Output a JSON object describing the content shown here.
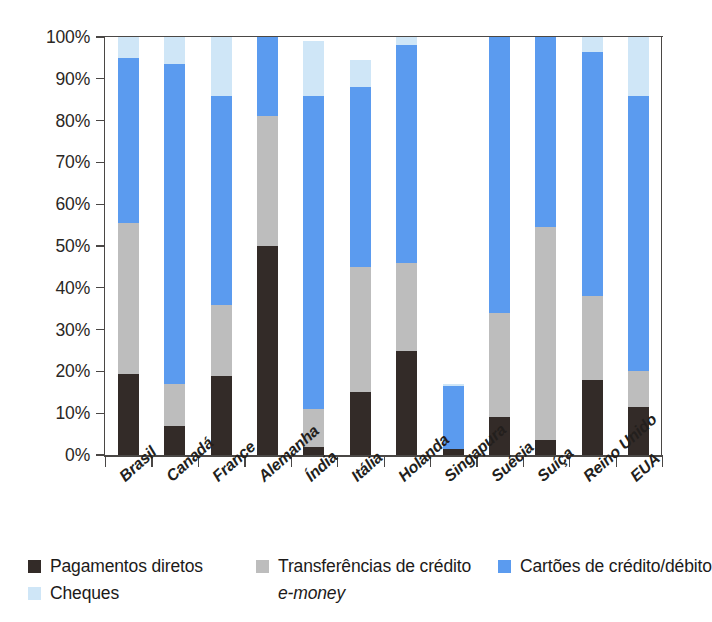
{
  "chart_data": {
    "type": "bar",
    "subtype": "stacked-bar-100",
    "title": "",
    "xlabel": "",
    "ylabel": "Porcentagem",
    "ylim": [
      0,
      100
    ],
    "ytick_labels": [
      "0%",
      "10%",
      "20%",
      "30%",
      "40%",
      "50%",
      "60%",
      "70%",
      "80%",
      "90%",
      "100%"
    ],
    "ytick_values": [
      0,
      10,
      20,
      30,
      40,
      50,
      60,
      70,
      80,
      90,
      100
    ],
    "grid": false,
    "legend_position": "bottom",
    "categories": [
      "Brasil",
      "Canadá",
      "France",
      "Alemanha",
      "Índia",
      "Itália",
      "Holanda",
      "Singapura",
      "Suécia",
      "Suíça",
      "Reino Unido",
      "EUA"
    ],
    "series": [
      {
        "name": "Pagamentos diretos",
        "color": "#332b28",
        "values": [
          19.5,
          7.0,
          19.0,
          50.0,
          2.0,
          15.0,
          25.0,
          1.5,
          9.0,
          3.5,
          18.0,
          11.5
        ]
      },
      {
        "name": "Transferências de crédito",
        "color": "#bdbdbd",
        "values": [
          36.0,
          10.0,
          17.0,
          31.0,
          9.0,
          30.0,
          21.0,
          0.0,
          25.0,
          51.0,
          20.0,
          8.5
        ]
      },
      {
        "name": "Cartões de crédito/débito",
        "color": "#5b9bef",
        "values": [
          39.5,
          76.5,
          50.0,
          19.0,
          75.0,
          43.0,
          52.0,
          15.0,
          66.0,
          45.5,
          58.5,
          66.0
        ]
      },
      {
        "name": "Cheques",
        "color": "#cfe6f7",
        "values": [
          5.0,
          6.5,
          14.0,
          0.0,
          13.0,
          6.5,
          2.0,
          0.5,
          0.0,
          0.0,
          3.5,
          14.0
        ]
      },
      {
        "name": "e-money",
        "color": "#ffffff",
        "values": [
          0,
          0,
          0,
          0,
          0,
          0,
          0,
          0,
          0,
          0,
          0,
          0
        ]
      }
    ],
    "bar_totals": [
      100,
      100,
      100,
      100,
      99,
      94.5,
      100,
      17,
      100,
      100,
      100,
      100
    ]
  },
  "legend": {
    "rows": [
      [
        {
          "label": "Pagamentos diretos",
          "color": "#332b28",
          "italic": false
        },
        {
          "label": "Transferências de crédito",
          "color": "#bdbdbd",
          "italic": false
        },
        {
          "label": "Cartões de crédito/débito",
          "color": "#5b9bef",
          "italic": false
        }
      ],
      [
        {
          "label": "Cheques",
          "color": "#cfe6f7",
          "italic": false
        },
        {
          "label": "e-money",
          "color": "#ffffff",
          "italic": true
        }
      ]
    ]
  }
}
